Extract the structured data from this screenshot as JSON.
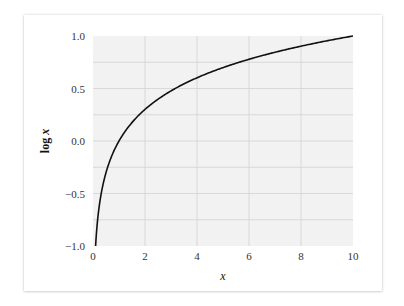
{
  "chart_data": {
    "type": "line",
    "title": "",
    "xlabel": "x",
    "ylabel": "log x",
    "xlim": [
      0,
      10
    ],
    "ylim": [
      -1.0,
      1.0
    ],
    "grid": true,
    "legend": null,
    "x_ticks": [
      "0",
      "2",
      "4",
      "6",
      "8",
      "10"
    ],
    "y_ticks": [
      "1.0",
      "0.5",
      "0.0",
      "−0.5",
      "−1.0"
    ],
    "series": [
      {
        "name": "log x",
        "function": "log10(x)",
        "x": [
          0.1,
          0.2,
          0.3,
          0.5,
          0.75,
          1,
          1.5,
          2,
          3,
          4,
          5,
          6,
          7,
          8,
          9,
          10
        ],
        "values": [
          -1.0,
          -0.699,
          -0.523,
          -0.301,
          -0.125,
          0.0,
          0.176,
          0.301,
          0.477,
          0.602,
          0.699,
          0.778,
          0.845,
          0.903,
          0.954,
          1.0
        ]
      }
    ],
    "colors": {
      "line": "#111111",
      "plot_bg": "#f2f2f2",
      "grid": "#d2d2d2"
    }
  },
  "labels": {
    "xlabel": "x",
    "ylabel_prefix": "log ",
    "ylabel_var": "x"
  }
}
